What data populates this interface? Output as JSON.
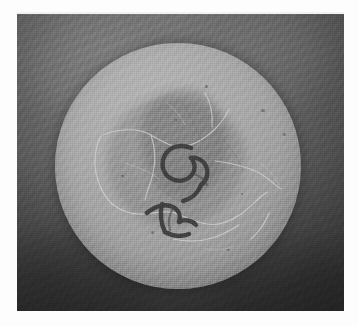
{
  "document": {
    "type": "grayscale-photograph",
    "medium": "scanned print on white page",
    "caption": "",
    "alt_text": "Black-and-white photograph of a circular stone disc with a worn central area and incised marks"
  },
  "page": {
    "background_color": "#fdfdfd",
    "width": 358,
    "height": 326
  },
  "photo": {
    "label": "photographic plate",
    "x": 17,
    "y": 14,
    "width": 327,
    "height": 297,
    "background_color": "#5e5e5e",
    "field": {
      "label": "mottled grey backdrop",
      "highlight_color": "#7b7b7b",
      "midtone_color": "#666666",
      "shadow_color": "#3a3a3a",
      "vignette": "lower-left darkest"
    }
  },
  "subject": {
    "name": "circular disc",
    "shape": "circle",
    "center_x": 177,
    "center_y": 165,
    "diameter": 246,
    "surface_color": "#a9a9a9",
    "highlight_color": "#b4b4b4",
    "edge_color": "#787878",
    "features": {
      "central_patch": {
        "label": "worn central patch",
        "color": "#585858"
      },
      "incised_marks": {
        "label": "incised marks",
        "color": "#3c3c3c",
        "reading": "54"
      },
      "cracks": {
        "label": "hairline surface cracks",
        "color": "#cfcfcf",
        "count": 11
      }
    }
  }
}
